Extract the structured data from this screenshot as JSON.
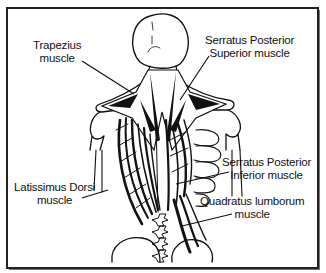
{
  "diagram": {
    "labels": [
      {
        "id": "trapezius",
        "line1": "Trapezius",
        "line2": "muscle"
      },
      {
        "id": "serratus-posterior-superior",
        "line1": "Serratus Posterior",
        "line2": "Superior muscle"
      },
      {
        "id": "serratus-posterior-inferior",
        "line1": "Serratus Posterior",
        "line2": "Inferior muscle"
      },
      {
        "id": "latissimus-dorsi",
        "line1": "Latissimus Dorsi",
        "line2": "muscle"
      },
      {
        "id": "quadratus-lumborum",
        "line1": "Quadratus lumborum",
        "line2": "muscle"
      }
    ]
  },
  "colors": {
    "ink": "#111111",
    "background": "#ffffff",
    "frame": "#222222"
  }
}
